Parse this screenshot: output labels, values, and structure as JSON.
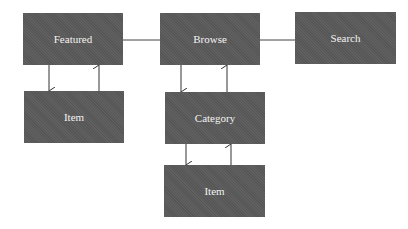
{
  "diagram": {
    "nodes": [
      {
        "id": "featured",
        "label": "Featured"
      },
      {
        "id": "browse",
        "label": "Browse"
      },
      {
        "id": "search",
        "label": "Search"
      },
      {
        "id": "item-featured",
        "label": "Item"
      },
      {
        "id": "category",
        "label": "Category"
      },
      {
        "id": "item-category",
        "label": "Item"
      }
    ],
    "edges": [
      {
        "from": "featured",
        "to": "browse",
        "type": "line"
      },
      {
        "from": "browse",
        "to": "search",
        "type": "line"
      },
      {
        "from": "featured",
        "to": "item-featured",
        "type": "arrow"
      },
      {
        "from": "item-featured",
        "to": "featured",
        "type": "arrow"
      },
      {
        "from": "browse",
        "to": "category",
        "type": "arrow"
      },
      {
        "from": "category",
        "to": "browse",
        "type": "arrow"
      },
      {
        "from": "category",
        "to": "item-category",
        "type": "arrow"
      },
      {
        "from": "item-category",
        "to": "category",
        "type": "arrow"
      }
    ],
    "colors": {
      "node_fill": "#5a5a5a",
      "node_text": "#f2f2f2",
      "edge": "#333333"
    }
  }
}
